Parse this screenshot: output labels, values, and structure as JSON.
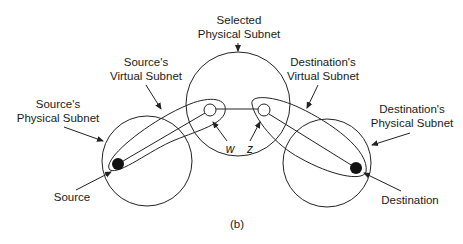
{
  "figure": {
    "caption": "(b)",
    "labels": {
      "selected_physical_subnet": [
        "Selected",
        "Physical Subnet"
      ],
      "source_virtual_subnet": [
        "Source's",
        "Virtual Subnet"
      ],
      "destination_virtual_subnet": [
        "Destination's",
        "Virtual Subnet"
      ],
      "source_physical_subnet": [
        "Source's",
        "Physical Subnet"
      ],
      "destination_physical_subnet": [
        "Destination's",
        "Physical Subnet"
      ],
      "source": "Source",
      "destination": "Destination",
      "node_w": "w",
      "node_z": "z"
    }
  }
}
